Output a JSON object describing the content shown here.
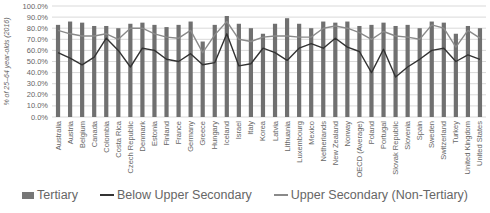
{
  "chart_data": {
    "type": "bar",
    "title": "",
    "xlabel": "",
    "ylabel": "% of 25–64 year-olds (2016)",
    "ylim": [
      0,
      100
    ],
    "yticks": [
      "0.0%",
      "10.0%",
      "20.0%",
      "30.0%",
      "40.0%",
      "50.0%",
      "60.0%",
      "70.0%",
      "80.0%",
      "90.0%",
      "100.0%"
    ],
    "grid": true,
    "legend_position": "bottom",
    "categories": [
      "Australia",
      "Austria",
      "Belgium",
      "Canada",
      "Colombia",
      "Costa Rica",
      "Czech Republic",
      "Denmark",
      "Estonia",
      "Finland",
      "France",
      "Germany",
      "Greece",
      "Hungary",
      "Iceland",
      "Israel",
      "Italy",
      "Korea",
      "Latvia",
      "Lithuania",
      "Luxembourg",
      "Mexico",
      "Netherlands",
      "New Zealand",
      "Norway",
      "OECD (Average)",
      "Poland",
      "Portugal",
      "Slovak Republic",
      "Slovenia",
      "Spain",
      "Sweden",
      "Switzerland",
      "Turkey",
      "United Kingdom",
      "United States"
    ],
    "series": [
      {
        "name": "Tertiary",
        "kind": "bar",
        "color": "#707070",
        "values": [
          83,
          86,
          85,
          82,
          82,
          80,
          84,
          85,
          83,
          81,
          83,
          86,
          68,
          83,
          91,
          84,
          80,
          75,
          84,
          89,
          84,
          80,
          86,
          85,
          86,
          82,
          83,
          85,
          82,
          83,
          80,
          86,
          85,
          75,
          82,
          80
        ]
      },
      {
        "name": "Below Upper Secondary",
        "kind": "line",
        "color": "#333333",
        "values": [
          58,
          53,
          47,
          54,
          71,
          60,
          45,
          62,
          60,
          52,
          50,
          57,
          47,
          49,
          75,
          46,
          48,
          62,
          58,
          51,
          62,
          66,
          62,
          71,
          63,
          59,
          40,
          61,
          36,
          45,
          52,
          60,
          62,
          50,
          56,
          52
        ]
      },
      {
        "name": "Upper Secondary (Non-Tertiary)",
        "kind": "line",
        "color": "#8a8a8a",
        "values": [
          78,
          75,
          73,
          73,
          75,
          70,
          80,
          80,
          75,
          72,
          71,
          78,
          58,
          74,
          86,
          70,
          68,
          72,
          73,
          73,
          72,
          72,
          80,
          82,
          80,
          76,
          70,
          77,
          73,
          72,
          70,
          83,
          80,
          63,
          78,
          71
        ]
      }
    ]
  },
  "legend": {
    "tertiary": "Tertiary",
    "below": "Below Upper Secondary",
    "upper": "Upper Secondary (Non-Tertiary)"
  }
}
